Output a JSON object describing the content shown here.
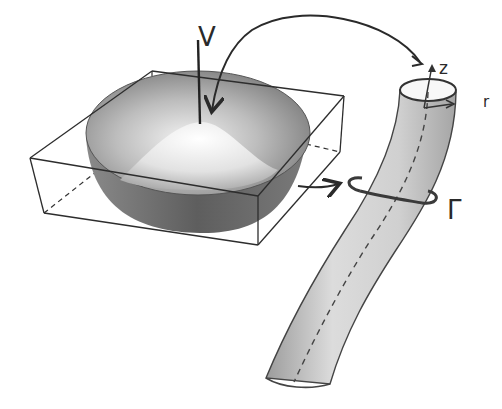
{
  "figure": {
    "labels": {
      "v": "V",
      "z": "z",
      "r": "r",
      "gamma": "Γ"
    },
    "elements": [
      {
        "name": "wireframe-box",
        "style": "thin dark outline, hidden edges dashed"
      },
      {
        "name": "bowl-surface",
        "shading": "gray gradient"
      },
      {
        "name": "central-peak",
        "shading": "light gray"
      },
      {
        "name": "curved-tube",
        "style": "stippled gray cylinder with dashed center axis"
      },
      {
        "name": "circulation-ring",
        "label": "Γ"
      },
      {
        "name": "arrow-peak-to-tube-top"
      },
      {
        "name": "arrow-bowl-to-ring"
      }
    ],
    "colors": {
      "ink": "#2a2a2a",
      "bowl_dark": "#6e6e6e",
      "bowl_light": "#e8e8e8",
      "tube": "#c9c9c9",
      "background": "#ffffff"
    }
  }
}
